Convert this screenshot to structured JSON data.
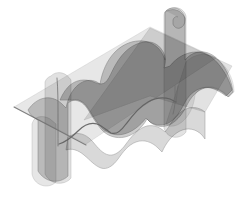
{
  "figure": {
    "title": "Wavy surface intersected by two cutting planes",
    "type": "3d-surface-plot",
    "background_color": "#ffffff",
    "width": 244,
    "height": 198,
    "colors": {
      "surface_fill": "#9a9a9a",
      "surface_edge": "#8c8c8c",
      "plane_fill": "#bdbdbd",
      "plane_edge": "#a8a8a8",
      "intersection_curve": "#5a5a5a",
      "straight_edge": "#6e6e6e",
      "background": "#ffffff"
    },
    "opacity": {
      "surface": 0.55,
      "plane": 0.45,
      "curve": 0.95
    },
    "elements": [
      {
        "name": "wavy-surface",
        "kind": "surface",
        "description": "Large undulating saddle-like sheet spanning the frame diagonally from lower-left to upper-right"
      },
      {
        "name": "vertical-plane-left",
        "kind": "plane",
        "description": "Narrow vertical cutting plane through the left portion of the surface"
      },
      {
        "name": "vertical-plane-right",
        "kind": "plane",
        "description": "Narrow vertical cutting plane through the right portion of the surface"
      },
      {
        "name": "oblique-plane",
        "kind": "plane",
        "description": "Oblique slab cutting across the surface from lower-left to upper-right"
      },
      {
        "name": "intersection-curve-sigmoid",
        "kind": "curve",
        "description": "Dark S-shaped curve where the oblique plane meets the wavy surface"
      },
      {
        "name": "intersection-curve-vertical",
        "kind": "curve",
        "description": "Dark curve where the left vertical plane meets the wavy surface"
      },
      {
        "name": "straight-cut-line",
        "kind": "line",
        "description": "Straight grey line marking the lower edge of the oblique plane"
      }
    ]
  }
}
